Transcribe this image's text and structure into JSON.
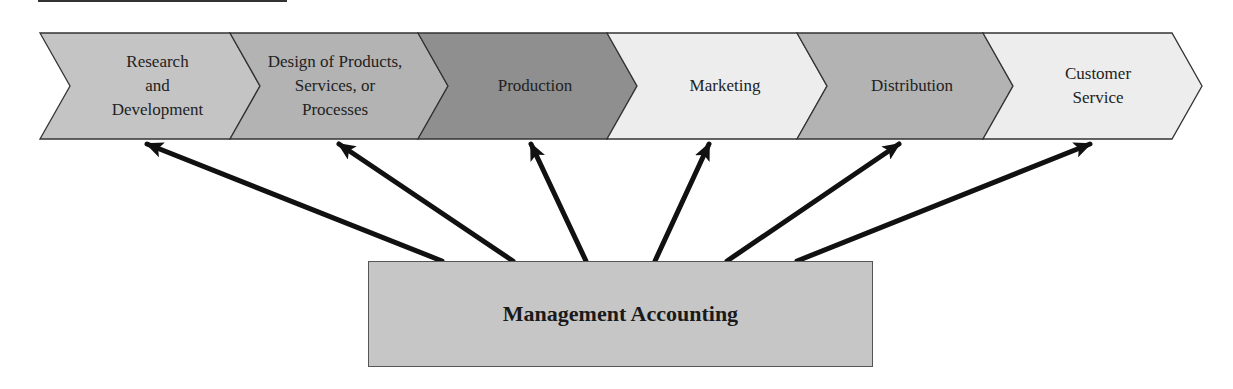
{
  "diagram": {
    "title_rule": true,
    "stages": [
      {
        "label": "Research\nand\nDevelopment",
        "fill": "#c4c4c4"
      },
      {
        "label": "Design of Products,\nServices, or\nProcesses",
        "fill": "#b3b3b3"
      },
      {
        "label": "Production",
        "fill": "#8f8f8f"
      },
      {
        "label": "Marketing",
        "fill": "#ededed"
      },
      {
        "label": "Distribution",
        "fill": "#b3b3b3"
      },
      {
        "label": "Customer\nService",
        "fill": "#ededed"
      }
    ],
    "center": {
      "label": "Management Accounting",
      "fill": "#c6c6c6"
    },
    "arrows": [
      {
        "from": "Management Accounting",
        "to": "Research and Development"
      },
      {
        "from": "Management Accounting",
        "to": "Design of Products, Services, or Processes"
      },
      {
        "from": "Management Accounting",
        "to": "Production"
      },
      {
        "from": "Management Accounting",
        "to": "Marketing"
      },
      {
        "from": "Management Accounting",
        "to": "Distribution"
      },
      {
        "from": "Management Accounting",
        "to": "Customer Service"
      }
    ]
  }
}
